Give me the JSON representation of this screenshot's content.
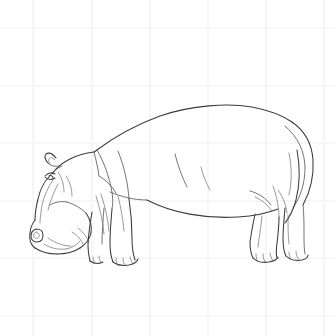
{
  "artwork": {
    "title": "Hippopotamus",
    "subject": "hippopotamus",
    "style": "line drawing",
    "orientation": "facing left, standing with head lowered",
    "medium": "pencil line art on graph paper",
    "canvas": {
      "width": 336,
      "height": 336,
      "background_color": "#ffffff"
    },
    "ink": {
      "primary_color": "#3b3b42",
      "secondary_color": "#5a5a63",
      "detail_color": "#6d6d76",
      "primary_width": 1.05,
      "secondary_width": 0.85,
      "detail_width": 0.7
    }
  },
  "background": {
    "type": "graph-paper-grid",
    "line_color": "#f4f4f5",
    "line_width": 1.6,
    "vertical_positions": [
      33,
      92,
      150,
      208,
      266,
      324
    ],
    "horizontal_positions": [
      28,
      86,
      143,
      201,
      258,
      316
    ]
  },
  "figure": {
    "bounding_box": {
      "x": 26,
      "y": 104,
      "width": 290,
      "height": 158
    },
    "parts": [
      {
        "name": "back-topline",
        "label": "Back / topline"
      },
      {
        "name": "head",
        "label": "Head"
      },
      {
        "name": "ear",
        "label": "Ear"
      },
      {
        "name": "eye",
        "label": "Eye"
      },
      {
        "name": "muzzle",
        "label": "Muzzle / snout"
      },
      {
        "name": "nostril",
        "label": "Nostril"
      },
      {
        "name": "jaw",
        "label": "Lower jaw"
      },
      {
        "name": "neck-crease",
        "label": "Neck crease"
      },
      {
        "name": "shoulder",
        "label": "Shoulder"
      },
      {
        "name": "belly",
        "label": "Belly line"
      },
      {
        "name": "foreleg-near",
        "label": "Near foreleg"
      },
      {
        "name": "foreleg-far",
        "label": "Far foreleg"
      },
      {
        "name": "hindleg-near",
        "label": "Near hind leg"
      },
      {
        "name": "hindleg-far",
        "label": "Far hind leg"
      },
      {
        "name": "rump",
        "label": "Rump"
      },
      {
        "name": "tail",
        "label": "Tail"
      },
      {
        "name": "hoof",
        "label": "Hoof with toes"
      },
      {
        "name": "flank-crease",
        "label": "Flank crease"
      }
    ]
  },
  "paths": {
    "topline": "M 94 152 C 110 140 132 126 160 116 C 192 105 228 103 252 107 C 268 110 280 114 292 122",
    "rump_outer": "M 292 122 C 305 131 312 145 313 160 C 314 176 310 192 303 205",
    "rump_inner": "M 285 126 C 298 137 305 152 305 168 C 305 184 300 198 293 208",
    "tail": "M 297 150 C 300 166 300 184 296 200 C 293 211 289 218 285 223",
    "tail_inner": "M 289 153 C 292 168 292 182 289 195",
    "belly": "M 147 200 C 172 213 205 219 238 217 C 254 216 268 213 278 209",
    "chest_to_belly": "M 110 192 C 122 197 134 200 147 200",
    "neck_crease": "M 97 150 C 104 162 109 176 112 192 C 113 199 113 204 112 209",
    "shoulder_crease": "M 118 151 C 124 166 128 183 129 199",
    "flank_crease": "M 175 154 C 178 166 182 177 187 187",
    "rear_flank_crease": "M 273 186 C 277 197 279 208 279 217",
    "head_top": "M 94 152 C 86 153 78 155 70 159 C 62 163 56 168 52 174",
    "head_back": "M 94 152 C 96 160 98 168 99 176",
    "ear_outer": "M 56 158 C 52 153 49 152 46 154 C 44 156 45 160 48 163",
    "ear_inner": "M 55 160 C 52 157 50 157 49 159 C 48 161 49 163 51 165",
    "ear_base": "M 48 163 C 51 166 55 167 59 166",
    "brow": "M 62 166 C 57 168 52 172 49 177",
    "eye_top": "M 45 176 C 48 173 52 172 55 174",
    "eye_bottom": "M 45 177 C 48 180 52 180 55 178",
    "eye_dot": "M 49 176 C 51 175 53 176 53 178",
    "cheek_1": "M 58 172 C 62 178 64 185 64 192",
    "cheek_2": "M 66 176 C 70 182 72 189 72 196",
    "face_front": "M 49 177 C 44 182 40 190 38 199 C 36 207 35 214 35 220",
    "face_front_2": "M 53 180 C 48 187 44 196 42 205 C 41 212 40 218 40 223",
    "face_front_3": "M 58 184 C 54 192 50 201 48 210",
    "muzzle_top": "M 35 220 C 32 224 30 229 30 234",
    "muzzle_front": "M 30 234 C 29 240 31 245 35 248",
    "muzzle_bottom": "M 35 248 C 41 252 49 254 57 254",
    "muzzle_to_jaw": "M 57 254 C 66 254 74 252 80 248",
    "jaw_line": "M 80 248 C 86 244 90 239 91 233",
    "jaw_back": "M 91 233 C 92 226 90 219 86 213",
    "jaw_to_cheek": "M 86 213 C 81 208 74 204 67 202",
    "cheek_to_head": "M 67 202 C 61 201 55 202 50 205",
    "nostril_outer": "M 36 229 C 33 230 31 233 31 236 C 31 240 34 242 37 242 C 41 242 43 239 43 235 C 43 231 40 229 36 229",
    "nostril_inner": "M 36 232 C 34 233 33 235 34 237 C 35 239 38 239 39 237 C 40 235 39 233 36 232",
    "lip_line": "M 44 244 C 50 248 58 250 66 249",
    "lip_line_2": "M 48 238 C 55 243 63 246 71 246",
    "mouth_fold": "M 66 249 C 72 248 77 245 80 241",
    "jowl_1": "M 72 232 C 77 235 81 239 83 244",
    "jowl_2": "M 78 228 C 83 232 87 237 89 242",
    "foreleg_near_front": "M 112 209 C 111 220 110 232 110 243 C 110 251 111 257 113 262",
    "foreleg_near_back": "M 129 199 C 131 212 132 226 132 238 C 132 247 133 254 135 260",
    "foreleg_near_hoof": "M 113 262 C 117 265 123 266 129 265 C 134 264 137 262 138 259",
    "foreleg_near_toe1": "M 116 258 C 116 262 117 265 119 266",
    "foreleg_near_toe2": "M 123 258 C 123 262 124 265 126 266",
    "foreleg_near_toe3": "M 130 257 C 131 260 132 263 133 264",
    "foreleg_far_front": "M 92 212 C 90 224 88 236 88 246 C 88 252 89 257 90 261",
    "foreleg_far_back": "M 104 208 C 103 221 102 234 102 244",
    "foreleg_far_hoof": "M 90 261 C 94 264 99 264 103 262",
    "foreleg_far_toe1": "M 93 257 C 93 260 94 262 95 263",
    "foreleg_far_toe2": "M 99 256 C 99 259 100 261 101 262",
    "fore_shoulder_mass": "M 99 176 C 106 180 112 186 116 193",
    "fore_muscle_1": "M 96 196 C 100 209 103 222 104 234",
    "fore_muscle_2": "M 101 194 C 105 206 108 219 109 231",
    "fore_muscle_3": "M 118 196 C 121 208 123 220 124 231",
    "hindleg_near_front": "M 255 214 C 253 224 251 234 250 242 C 250 249 251 254 253 258",
    "hindleg_near_back": "M 279 217 C 279 226 278 235 277 243 C 276 250 276 254 277 258",
    "hindleg_near_hoof": "M 253 258 C 257 262 263 263 269 262 C 274 261 277 260 278 257",
    "hindleg_near_toe1": "M 256 254 C 256 258 257 261 259 262",
    "hindleg_near_toe2": "M 263 254 C 263 258 264 261 266 262",
    "hindleg_near_toe3": "M 270 253 C 271 257 272 260 273 261",
    "hindleg_far_front": "M 285 208 C 284 219 283 230 283 239 C 283 246 284 252 286 256",
    "hindleg_far_back": "M 303 205 C 304 214 304 224 304 233 C 304 242 304 249 305 254",
    "hindleg_far_hoof": "M 286 256 C 290 260 296 261 302 260 C 306 259 308 257 308 255",
    "hindleg_far_toe1": "M 289 252 C 289 256 290 259 292 260",
    "hindleg_far_toe2": "M 296 251 C 296 255 297 258 299 259",
    "hind_haunch_1": "M 250 191 C 258 193 266 198 271 205",
    "hind_haunch_2": "M 255 197 C 262 200 268 205 272 211",
    "hind_muscle_1": "M 262 216 C 261 227 259 238 258 247",
    "hind_muscle_2": "M 288 215 C 288 225 288 235 289 244",
    "rear_thigh_crease": "M 278 190 C 283 197 286 205 287 213",
    "body_fold_mid": "M 201 167 C 203 175 206 183 210 190"
  }
}
